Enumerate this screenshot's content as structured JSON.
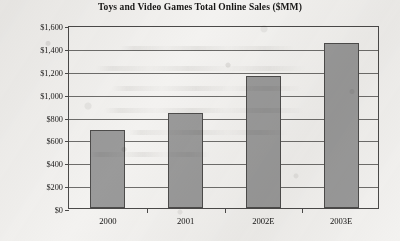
{
  "chart_data": {
    "type": "bar",
    "title": "Toys and Video Games Total Online Sales ($MM)",
    "xlabel": "",
    "ylabel": "",
    "categories": [
      "2000",
      "2001",
      "2002E",
      "2003E"
    ],
    "values": [
      680,
      830,
      1150,
      1440
    ],
    "ylim": [
      0,
      1600
    ],
    "ytick_values": [
      0,
      200,
      400,
      600,
      800,
      1000,
      1200,
      1400,
      1600
    ],
    "ytick_labels": [
      "$0",
      "$200",
      "$400",
      "$600",
      "$800",
      "$1,000",
      "$1,200",
      "$1,400",
      "$1,600"
    ],
    "grid": true,
    "legend": false,
    "bar_color": "#9a9a9a",
    "bar_edge_color": "#4d4c4b",
    "axis_color": "#4b4a49",
    "background_color": "#f3f2f0"
  }
}
